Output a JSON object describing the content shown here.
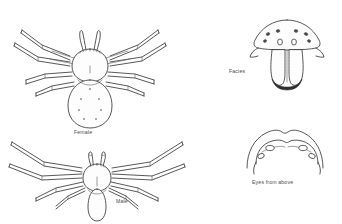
{
  "plate": {
    "width": 342,
    "height": 224,
    "background_color": "#ffffff",
    "ink_color": "#3a3a3c",
    "spot_color": "#8c8c90"
  },
  "figures": [
    {
      "id": "female-dorsal",
      "caption": "Female",
      "view": "dorsal habitus",
      "sex": "female",
      "abdomen_spot_count": 7
    },
    {
      "id": "male-dorsal",
      "caption": "Male",
      "view": "dorsal habitus",
      "sex": "male",
      "abdomen_spot_count": 0
    },
    {
      "id": "facies",
      "caption": "Facies",
      "view": "anterior face",
      "eye_count": 8
    },
    {
      "id": "eyes-from-above",
      "caption": "Eyes from above",
      "view": "dorsal eye arrangement",
      "eye_count": 8
    }
  ],
  "captions": {
    "female": "Female",
    "male": "Male",
    "facies": "Facies",
    "eyes_from_above": "Eyes from above"
  }
}
